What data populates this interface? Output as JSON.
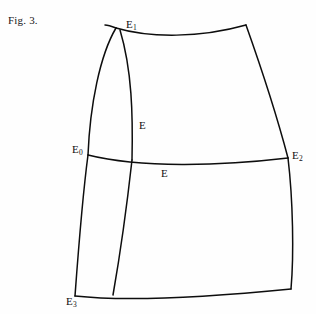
{
  "figure": {
    "caption": "Fig. 3.",
    "background_color": "#fefefe",
    "stroke_color": "#0d0d0d",
    "width": 316,
    "height": 314
  },
  "labels": {
    "vertices": [
      {
        "name": "E0",
        "base": "E",
        "subscript": "0",
        "x": 72,
        "y": 143
      },
      {
        "name": "E1",
        "base": "E",
        "subscript": "1",
        "x": 126,
        "y": 18
      },
      {
        "name": "E2",
        "base": "E",
        "subscript": "2",
        "x": 292,
        "y": 149
      },
      {
        "name": "E3",
        "base": "E",
        "subscript": "3",
        "x": 66,
        "y": 295
      }
    ],
    "edges": [
      {
        "name": "E-interior-upper",
        "text": "E",
        "x": 139,
        "y": 119
      },
      {
        "name": "E-interior-lower",
        "text": "E",
        "x": 161,
        "y": 167
      }
    ]
  },
  "curves": [
    {
      "name": "top-edge",
      "d": "M 116 28 C 150 38, 200 38, 246 25"
    },
    {
      "name": "right-edge-upper",
      "d": "M 246 25 C 262 70, 278 120, 288 158"
    },
    {
      "name": "right-edge-lower",
      "d": "M 288 158 C 293 200, 294 255, 291 289"
    },
    {
      "name": "bottom-edge",
      "d": "M 75 296 C 130 302, 220 296, 291 289"
    },
    {
      "name": "left-outer-upper",
      "d": "M 116 28 C 100 55, 90 105, 88 155"
    },
    {
      "name": "left-outer-lower",
      "d": "M 88 155 C 82 200, 78 255, 75 296"
    },
    {
      "name": "left-inner-upper",
      "d": "M 120 30 C 132 70, 133 115, 132 160"
    },
    {
      "name": "left-inner-lower",
      "d": "M 132 160 C 127 205, 120 255, 113 295"
    },
    {
      "name": "middle-horizontal",
      "d": "M 88 155 C 140 168, 220 166, 288 158"
    },
    {
      "name": "left-outer-tip",
      "d": "M 116 28 C 111 26, 108 25, 105 25"
    }
  ]
}
